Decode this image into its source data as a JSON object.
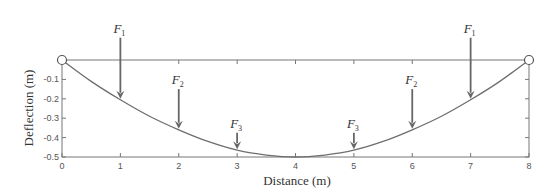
{
  "chart_data": {
    "type": "line",
    "title": "",
    "xlabel": "Distance (m)",
    "ylabel": "Deflection (m)",
    "xlim": [
      0,
      8
    ],
    "ylim": [
      -0.5,
      0
    ],
    "xticks": [
      "0",
      "1",
      "2",
      "3",
      "4",
      "5",
      "6",
      "7",
      "8"
    ],
    "yticks": [
      "-0.1",
      "-0.2",
      "-0.3",
      "-0.4",
      "-0.5"
    ],
    "grid": false,
    "series": [
      {
        "name": "deflection",
        "x": [
          0,
          0.5,
          1,
          1.5,
          2,
          2.5,
          3,
          3.5,
          4,
          4.5,
          5,
          5.5,
          6,
          6.5,
          7,
          7.5,
          8
        ],
        "y": [
          0,
          -0.11,
          -0.205,
          -0.29,
          -0.36,
          -0.42,
          -0.465,
          -0.49,
          -0.5,
          -0.49,
          -0.465,
          -0.42,
          -0.36,
          -0.29,
          -0.205,
          -0.11,
          0
        ]
      }
    ],
    "supports": [
      {
        "x": 0,
        "y": 0,
        "type": "pin"
      },
      {
        "x": 8,
        "y": 0,
        "type": "pin"
      }
    ],
    "forces": [
      {
        "label": "F",
        "sub": "1",
        "x": 1,
        "tip_y": -0.205,
        "length": 0.32
      },
      {
        "label": "F",
        "sub": "2",
        "x": 2,
        "tip_y": -0.36,
        "length": 0.21
      },
      {
        "label": "F",
        "sub": "3",
        "x": 3,
        "tip_y": -0.465,
        "length": 0.09
      },
      {
        "label": "F",
        "sub": "3",
        "x": 5,
        "tip_y": -0.465,
        "length": 0.09
      },
      {
        "label": "F",
        "sub": "2",
        "x": 6,
        "tip_y": -0.36,
        "length": 0.21
      },
      {
        "label": "F",
        "sub": "1",
        "x": 7,
        "tip_y": -0.205,
        "length": 0.32
      }
    ],
    "colors": {
      "curve": "#6e6e6e",
      "arrow": "#666666",
      "axis": "#777777"
    }
  }
}
